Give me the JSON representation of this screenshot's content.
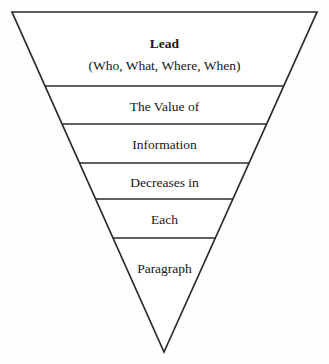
{
  "diagram": {
    "type": "inverted-pyramid",
    "background_color": "#ffffff",
    "line_color": "#2b2b2b",
    "text_color": "#161616",
    "geometry": {
      "top_left_x": 12,
      "top_right_x": 317,
      "top_y": 12,
      "apex_x": 164,
      "apex_y": 352,
      "divider_y": [
        86,
        124,
        163,
        199,
        238
      ]
    },
    "bands": [
      {
        "id": "band-lead",
        "name": "lead",
        "lines": [
          {
            "text": "Lead",
            "bold": true,
            "y": 34
          },
          {
            "text": "(Who, What, Where, When)",
            "bold": false,
            "y": 56
          }
        ]
      },
      {
        "id": "band-the-value-of",
        "name": "the-value-of",
        "lines": [
          {
            "text": "The Value of",
            "bold": false,
            "y": 97
          }
        ]
      },
      {
        "id": "band-information",
        "name": "information",
        "lines": [
          {
            "text": "Information",
            "bold": false,
            "y": 135
          }
        ]
      },
      {
        "id": "band-decreases-in",
        "name": "decreases-in",
        "lines": [
          {
            "text": "Decreases in",
            "bold": false,
            "y": 173
          }
        ]
      },
      {
        "id": "band-each",
        "name": "each",
        "lines": [
          {
            "text": "Each",
            "bold": false,
            "y": 210
          }
        ]
      },
      {
        "id": "band-paragraph",
        "name": "paragraph",
        "lines": [
          {
            "text": "Paragraph",
            "bold": false,
            "y": 259
          }
        ]
      }
    ]
  }
}
